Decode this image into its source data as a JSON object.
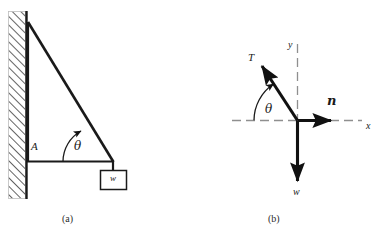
{
  "figure": {
    "panels": [
      {
        "caption": "(a)",
        "name": "physical-setup",
        "labels": {
          "support_point": "A",
          "angle": "θ",
          "weight_box": "w"
        },
        "elements": [
          "hatched-wall",
          "vertical-member",
          "horizontal-member",
          "diagonal-strut",
          "angle-arc",
          "weight-block"
        ]
      },
      {
        "caption": "(b)",
        "name": "free-body-diagram",
        "labels": {
          "tension_vector": "T",
          "normal_vector": "n",
          "weight_vector": "w",
          "angle": "θ",
          "y_axis": "y",
          "x_axis": "x"
        },
        "elements": [
          "x-axis-dashed",
          "y-axis-dashed",
          "tension-arrow",
          "normal-arrow",
          "weight-arrow",
          "angle-arc"
        ]
      }
    ],
    "colors": {
      "stroke": "#1a1a1a",
      "wall_fill": "#ffffff",
      "background": "#ffffff",
      "axis_dash": "#8c8c8c"
    }
  }
}
